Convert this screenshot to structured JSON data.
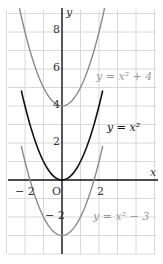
{
  "chart_data": {
    "type": "line",
    "title": "",
    "xlabel": "x",
    "ylabel": "y",
    "origin_label": "O",
    "xlim": [
      -3,
      5
    ],
    "ylim": [
      -4,
      9
    ],
    "grid": true,
    "x_tick_labels": [
      {
        "value": -2,
        "label": "− 2"
      },
      {
        "value": 2,
        "label": "2"
      }
    ],
    "y_tick_labels": [
      {
        "value": 8,
        "label": "8"
      },
      {
        "value": 6,
        "label": "6"
      },
      {
        "value": 4,
        "label": "4"
      },
      {
        "value": 2,
        "label": "2"
      },
      {
        "value": -2,
        "label": "− 2"
      }
    ],
    "series": [
      {
        "name": "y = x² + 4",
        "formula": "x^2+4",
        "color": "#8a8a8a",
        "label_text": "y = x² + 4",
        "x_range": [
          -2.3,
          2.3
        ]
      },
      {
        "name": "y = x²",
        "formula": "x^2",
        "color": "#111111",
        "label_text": "y = x²",
        "x_range": [
          -2.2,
          2.2
        ]
      },
      {
        "name": "y = x² − 3",
        "formula": "x^2-3",
        "color": "#8a8a8a",
        "label_text": "y = x² − 3",
        "x_range": [
          -2.2,
          2.2
        ]
      }
    ]
  }
}
